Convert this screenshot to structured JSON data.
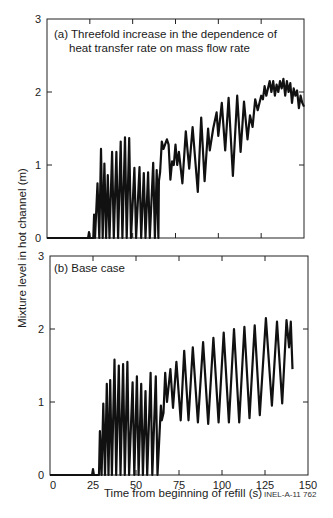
{
  "figure_id": "INEL-A-11 762",
  "chart_data": [
    {
      "type": "line",
      "panel": "a",
      "title": "(a) Threefold increase in the dependence of",
      "title_line2": "heat transfer rate on mass flow rate",
      "xlabel": "Time from beginning of refill (s)",
      "ylabel": "Mixture level in hot channel (m)",
      "xlim": [
        0,
        150
      ],
      "ylim": [
        0,
        3
      ],
      "xticks": [
        0,
        25,
        50,
        75,
        100,
        125,
        150
      ],
      "yticks": [
        0,
        1,
        2,
        3
      ],
      "grid": false,
      "series": [
        {
          "name": "Mixture level",
          "points": [
            [
              0,
              0
            ],
            [
              24,
              0
            ],
            [
              24.5,
              0.08
            ],
            [
              25,
              0
            ],
            [
              27,
              0
            ],
            [
              27.5,
              0.32
            ],
            [
              28,
              0
            ],
            [
              29.5,
              0.75
            ],
            [
              30.5,
              0
            ],
            [
              31.5,
              1.22
            ],
            [
              32.5,
              0
            ],
            [
              33.5,
              1.02
            ],
            [
              34.5,
              0
            ],
            [
              35.5,
              0.86
            ],
            [
              36.5,
              0
            ],
            [
              38,
              1.18
            ],
            [
              39,
              0
            ],
            [
              40.5,
              1.18
            ],
            [
              41.5,
              0
            ],
            [
              43,
              1.32
            ],
            [
              44,
              0
            ],
            [
              45.5,
              1.38
            ],
            [
              46.5,
              0
            ],
            [
              48,
              1.37
            ],
            [
              49,
              0
            ],
            [
              51,
              0.96
            ],
            [
              52,
              0
            ],
            [
              54,
              0.97
            ],
            [
              55,
              0
            ],
            [
              56.5,
              0.89
            ],
            [
              57.5,
              0
            ],
            [
              59,
              0.9
            ],
            [
              60,
              0
            ],
            [
              62,
              1.03
            ],
            [
              63,
              0
            ],
            [
              64,
              0.93
            ],
            [
              65,
              0
            ],
            [
              65.3,
              0.78
            ],
            [
              66,
              0.9
            ],
            [
              67,
              1.32
            ],
            [
              68,
              1.22
            ],
            [
              70,
              1.35
            ],
            [
              71,
              1.28
            ],
            [
              72,
              0.8
            ],
            [
              73,
              1.05
            ],
            [
              74,
              1.0
            ],
            [
              75,
              1.28
            ],
            [
              76,
              1.0
            ],
            [
              77,
              1.18
            ],
            [
              79,
              0.75
            ],
            [
              81,
              1.46
            ],
            [
              83,
              0.95
            ],
            [
              85,
              1.52
            ],
            [
              88,
              0.63
            ],
            [
              90,
              1.65
            ],
            [
              92,
              0.78
            ],
            [
              94,
              1.5
            ],
            [
              95,
              1.2
            ],
            [
              97,
              1.5
            ],
            [
              99,
              1.72
            ],
            [
              100,
              1.4
            ],
            [
              102,
              1.85
            ],
            [
              104,
              1.2
            ],
            [
              106,
              1.92
            ],
            [
              108.5,
              0.85
            ],
            [
              111,
              1.95
            ],
            [
              113,
              1.18
            ],
            [
              115,
              1.87
            ],
            [
              117,
              1.35
            ],
            [
              118.5,
              1.68
            ],
            [
              120,
              1.52
            ],
            [
              121.5,
              1.9
            ],
            [
              123,
              1.75
            ],
            [
              125,
              1.95
            ],
            [
              126,
              1.9
            ],
            [
              127,
              2.08
            ],
            [
              128,
              1.95
            ],
            [
              130,
              2.15
            ],
            [
              131,
              2.0
            ],
            [
              132,
              2.15
            ],
            [
              133,
              1.95
            ],
            [
              134,
              2.1
            ],
            [
              135,
              2.0
            ],
            [
              136,
              2.15
            ],
            [
              137,
              2.05
            ],
            [
              138,
              2.18
            ],
            [
              139,
              1.95
            ],
            [
              140,
              2.15
            ],
            [
              141,
              2.0
            ],
            [
              142,
              2.12
            ],
            [
              143,
              1.85
            ],
            [
              144,
              2.05
            ],
            [
              145,
              1.95
            ],
            [
              146,
              2.02
            ],
            [
              147,
              1.78
            ],
            [
              148,
              1.95
            ],
            [
              149,
              1.85
            ],
            [
              150,
              1.8
            ]
          ]
        }
      ]
    },
    {
      "type": "line",
      "panel": "b",
      "title": "(b)  Base case",
      "xlabel": "Time from beginning of refill (s)",
      "ylabel": "Mixture level in hot channel (m)",
      "xlim": [
        0,
        150
      ],
      "ylim": [
        0,
        3
      ],
      "xticks": [
        0,
        25,
        50,
        75,
        100,
        125,
        150
      ],
      "yticks": [
        0,
        1,
        2,
        3
      ],
      "grid": false,
      "series": [
        {
          "name": "Mixture level",
          "points": [
            [
              0,
              0
            ],
            [
              24.5,
              0
            ],
            [
              25,
              0.08
            ],
            [
              25.5,
              0
            ],
            [
              28.5,
              0
            ],
            [
              29,
              0.6
            ],
            [
              30,
              0
            ],
            [
              31,
              0.98
            ],
            [
              32,
              0
            ],
            [
              33,
              1.25
            ],
            [
              34,
              0
            ],
            [
              35,
              1.3
            ],
            [
              36,
              0
            ],
            [
              37.5,
              1.58
            ],
            [
              38.5,
              0
            ],
            [
              40,
              1.5
            ],
            [
              41,
              0
            ],
            [
              42.5,
              1.52
            ],
            [
              43.5,
              0
            ],
            [
              45,
              1.55
            ],
            [
              46,
              0
            ],
            [
              48,
              1.27
            ],
            [
              49,
              0
            ],
            [
              50.5,
              1.35
            ],
            [
              51.5,
              0
            ],
            [
              53,
              1.25
            ],
            [
              54,
              0
            ],
            [
              55.5,
              1.15
            ],
            [
              56.5,
              0
            ],
            [
              58.5,
              1.4
            ],
            [
              59.5,
              0
            ],
            [
              61.5,
              1.35
            ],
            [
              62.5,
              0
            ],
            [
              64.5,
              0.95
            ],
            [
              65,
              0.75
            ],
            [
              66,
              0.85
            ],
            [
              67,
              1.4
            ],
            [
              68,
              1.0
            ],
            [
              70,
              1.45
            ],
            [
              71.5,
              0.92
            ],
            [
              73.5,
              1.55
            ],
            [
              76,
              0.75
            ],
            [
              78,
              1.7
            ],
            [
              80.5,
              0.75
            ],
            [
              83,
              1.75
            ],
            [
              86,
              0.72
            ],
            [
              89,
              1.82
            ],
            [
              92,
              0.7
            ],
            [
              95,
              1.88
            ],
            [
              98,
              0.72
            ],
            [
              101,
              1.95
            ],
            [
              104,
              0.72
            ],
            [
              107,
              2.0
            ],
            [
              110,
              0.72
            ],
            [
              113,
              2.03
            ],
            [
              116,
              0.78
            ],
            [
              119,
              2.05
            ],
            [
              122,
              0.82
            ],
            [
              125.5,
              2.15
            ],
            [
              129,
              0.95
            ],
            [
              132,
              2.1
            ],
            [
              135,
              0.98
            ],
            [
              137.5,
              2.12
            ],
            [
              139,
              1.75
            ],
            [
              140,
              2.1
            ],
            [
              141,
              1.45
            ]
          ]
        }
      ]
    }
  ]
}
